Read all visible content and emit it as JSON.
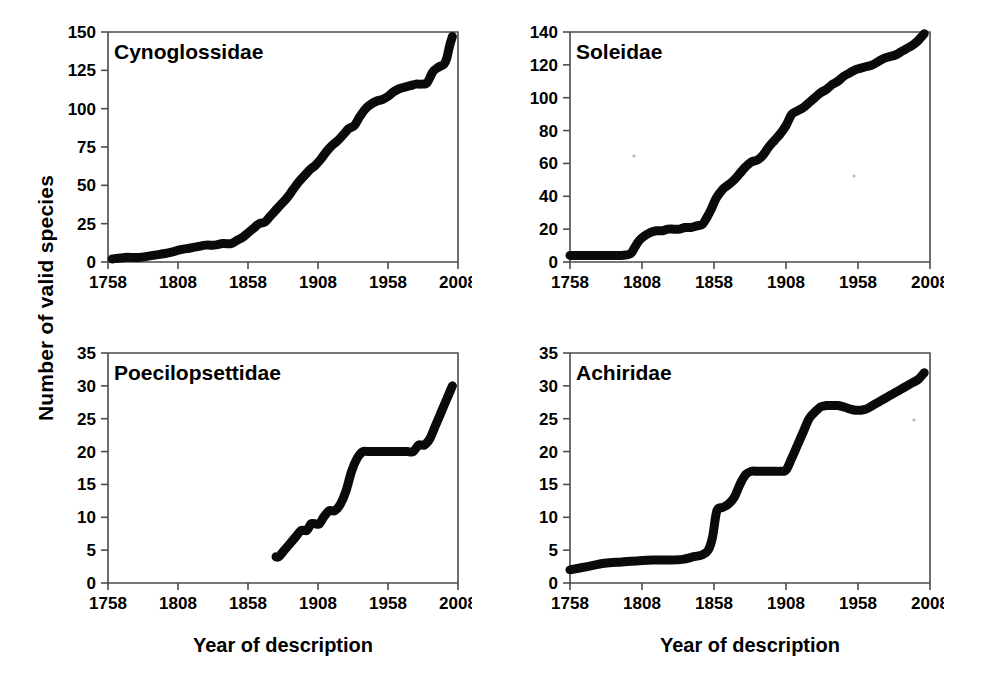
{
  "figure": {
    "y_axis_title": "Number of valid species",
    "x_axis_title_left": "Year of description",
    "x_axis_title_right": "Year of description"
  },
  "chart_data": [
    {
      "type": "line",
      "title": "Cynoglossidae",
      "xlabel": "Year of description",
      "ylabel": "Number of valid species",
      "xlim": [
        1758,
        2008
      ],
      "ylim": [
        0,
        150
      ],
      "xticks": [
        1758,
        1808,
        1858,
        1908,
        1958,
        2008
      ],
      "yticks": [
        0,
        25,
        50,
        75,
        100,
        125,
        150
      ],
      "grid": false,
      "legend": "none",
      "x": [
        1761,
        1770,
        1780,
        1788,
        1795,
        1801,
        1810,
        1816,
        1822,
        1828,
        1834,
        1840,
        1846,
        1850,
        1854,
        1858,
        1862,
        1866,
        1870,
        1874,
        1878,
        1882,
        1886,
        1890,
        1894,
        1898,
        1902,
        1906,
        1910,
        1914,
        1918,
        1922,
        1926,
        1930,
        1934,
        1938,
        1942,
        1946,
        1950,
        1954,
        1958,
        1962,
        1966,
        1970,
        1974,
        1978,
        1982,
        1986,
        1990,
        1994,
        1998,
        2000,
        2002,
        2004
      ],
      "y": [
        2,
        3,
        3,
        4,
        5,
        6,
        8,
        9,
        10,
        11,
        11,
        12,
        12,
        14,
        16,
        19,
        22,
        25,
        26,
        30,
        34,
        38,
        42,
        47,
        52,
        56,
        60,
        63,
        67,
        72,
        76,
        79,
        83,
        87,
        89,
        95,
        100,
        103,
        105,
        106,
        108,
        111,
        113,
        114,
        115,
        116,
        116,
        117,
        124,
        127,
        129,
        133,
        141,
        147
      ]
    },
    {
      "type": "line",
      "title": "Soleidae",
      "xlabel": "Year of description",
      "ylabel": "Number of valid species",
      "xlim": [
        1758,
        2008
      ],
      "ylim": [
        0,
        140
      ],
      "xticks": [
        1758,
        1808,
        1858,
        1908,
        1958,
        2008
      ],
      "yticks": [
        0,
        20,
        40,
        60,
        80,
        100,
        120,
        140
      ],
      "grid": false,
      "legend": "none",
      "x": [
        1758,
        1770,
        1782,
        1794,
        1800,
        1803,
        1806,
        1810,
        1814,
        1818,
        1822,
        1826,
        1830,
        1834,
        1838,
        1842,
        1846,
        1850,
        1853,
        1856,
        1859,
        1862,
        1865,
        1868,
        1872,
        1876,
        1880,
        1884,
        1888,
        1892,
        1896,
        1900,
        1904,
        1908,
        1912,
        1916,
        1920,
        1924,
        1928,
        1932,
        1936,
        1940,
        1944,
        1948,
        1952,
        1956,
        1960,
        1964,
        1968,
        1972,
        1976,
        1980,
        1984,
        1988,
        1992,
        1996,
        2000,
        2004
      ],
      "y": [
        4,
        4,
        4,
        4,
        5,
        9,
        13,
        16,
        18,
        19,
        19,
        20,
        20,
        20,
        21,
        21,
        22,
        23,
        27,
        32,
        38,
        42,
        45,
        47,
        50,
        54,
        58,
        61,
        62,
        65,
        70,
        74,
        78,
        83,
        90,
        92,
        94,
        97,
        100,
        103,
        105,
        108,
        110,
        113,
        115,
        117,
        118,
        119,
        120,
        122,
        124,
        125,
        126,
        128,
        130,
        132,
        135,
        139
      ]
    },
    {
      "type": "line",
      "title": "Poecilopsettidae",
      "xlabel": "Year of description",
      "ylabel": "Number of valid species",
      "xlim": [
        1758,
        2008
      ],
      "ylim": [
        0,
        35
      ],
      "xticks": [
        1758,
        1808,
        1858,
        1908,
        1958,
        2008
      ],
      "yticks": [
        0,
        5,
        10,
        15,
        20,
        25,
        30,
        35
      ],
      "grid": false,
      "legend": "none",
      "x": [
        1878,
        1880,
        1884,
        1888,
        1892,
        1896,
        1900,
        1903,
        1906,
        1909,
        1912,
        1916,
        1920,
        1924,
        1928,
        1932,
        1936,
        1940,
        1944,
        1948,
        1952,
        1956,
        1960,
        1964,
        1968,
        1972,
        1976,
        1980,
        1984,
        1988,
        1992,
        1996,
        2000,
        2004
      ],
      "y": [
        4,
        4,
        5,
        6,
        7,
        8,
        8,
        9,
        9,
        9,
        10,
        11,
        11,
        12,
        14,
        17,
        19,
        20,
        20,
        20,
        20,
        20,
        20,
        20,
        20,
        20,
        20,
        21,
        21,
        22,
        24,
        26,
        28,
        30
      ]
    },
    {
      "type": "line",
      "title": "Achiridae",
      "xlabel": "Year of description",
      "ylabel": "Number of valid species",
      "xlim": [
        1758,
        2008
      ],
      "ylim": [
        0,
        35
      ],
      "xticks": [
        1758,
        1808,
        1858,
        1908,
        1958,
        2008
      ],
      "yticks": [
        0,
        5,
        10,
        15,
        20,
        25,
        30,
        35
      ],
      "grid": false,
      "legend": "none",
      "x": [
        1758,
        1770,
        1782,
        1794,
        1806,
        1816,
        1826,
        1836,
        1844,
        1850,
        1854,
        1857,
        1860,
        1864,
        1868,
        1872,
        1876,
        1880,
        1884,
        1888,
        1892,
        1896,
        1900,
        1904,
        1908,
        1912,
        1916,
        1920,
        1924,
        1928,
        1932,
        1936,
        1940,
        1944,
        1948,
        1952,
        1956,
        1960,
        1964,
        1968,
        1972,
        1976,
        1980,
        1984,
        1988,
        1992,
        1996,
        2000,
        2004
      ],
      "y": [
        2,
        2.5,
        3,
        3.2,
        3.4,
        3.5,
        3.5,
        3.6,
        4,
        4.3,
        5,
        7,
        11,
        11.5,
        12,
        13,
        15,
        16.5,
        17,
        17,
        17,
        17,
        17,
        17,
        17.2,
        19,
        21,
        23,
        25,
        26,
        26.8,
        27,
        27,
        27,
        26.8,
        26.5,
        26.3,
        26.3,
        26.5,
        27,
        27.5,
        28,
        28.5,
        29,
        29.5,
        30,
        30.5,
        31,
        32
      ]
    }
  ]
}
